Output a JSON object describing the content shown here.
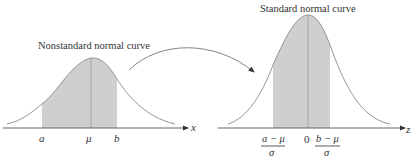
{
  "left_panel": {
    "title": "Nonstandard normal curve",
    "axis_label": "x",
    "ticks": {
      "a": "a",
      "mu": "μ",
      "b": "b"
    }
  },
  "right_panel": {
    "title": "Standard normal curve",
    "axis_label": "z",
    "ticks": {
      "zero": "0",
      "left_num": "a − μ",
      "left_den": "σ",
      "right_num": "b − μ",
      "right_den": "σ"
    }
  },
  "colors": {
    "shade": "#cfcfcf",
    "curve": "#8a8a8a",
    "axis": "#555555",
    "text": "#333333"
  }
}
